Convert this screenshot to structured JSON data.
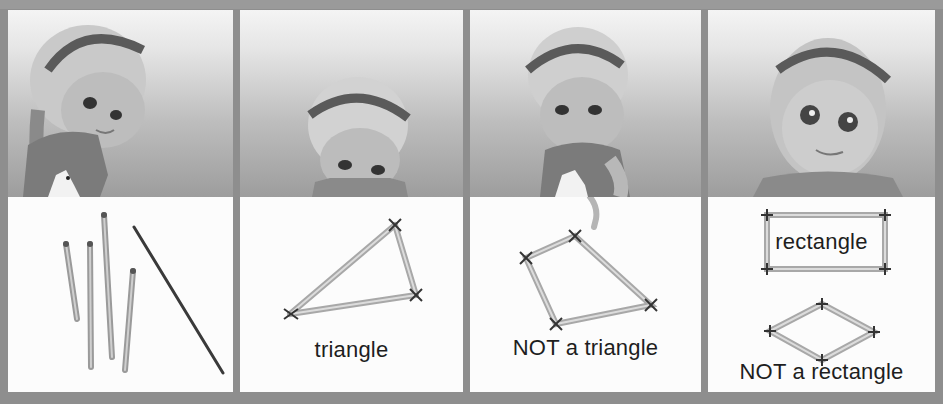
{
  "page": {
    "background": "#8e8e8e",
    "panel_border_color": "#8e8e8e"
  },
  "panels": [
    {
      "id": "loose-sticks",
      "caption": "",
      "scene": "girl-looking-down-at-sticks",
      "board_items": [
        "stick",
        "stick",
        "stick",
        "stick",
        "thin-rod"
      ]
    },
    {
      "id": "triangle",
      "caption": "triangle",
      "scene": "girl-peeking-over-board",
      "board_items": [
        "triangle-of-sticks"
      ]
    },
    {
      "id": "not-triangle",
      "caption": "NOT a triangle",
      "scene": "girl-pointing-at-shape",
      "board_items": [
        "quadrilateral-of-sticks"
      ]
    },
    {
      "id": "rectangle",
      "caption_top": "rectangle",
      "caption": "NOT a rectangle",
      "scene": "girl-smiling",
      "board_items": [
        "rectangle-of-sticks",
        "rhombus-of-sticks"
      ]
    }
  ]
}
